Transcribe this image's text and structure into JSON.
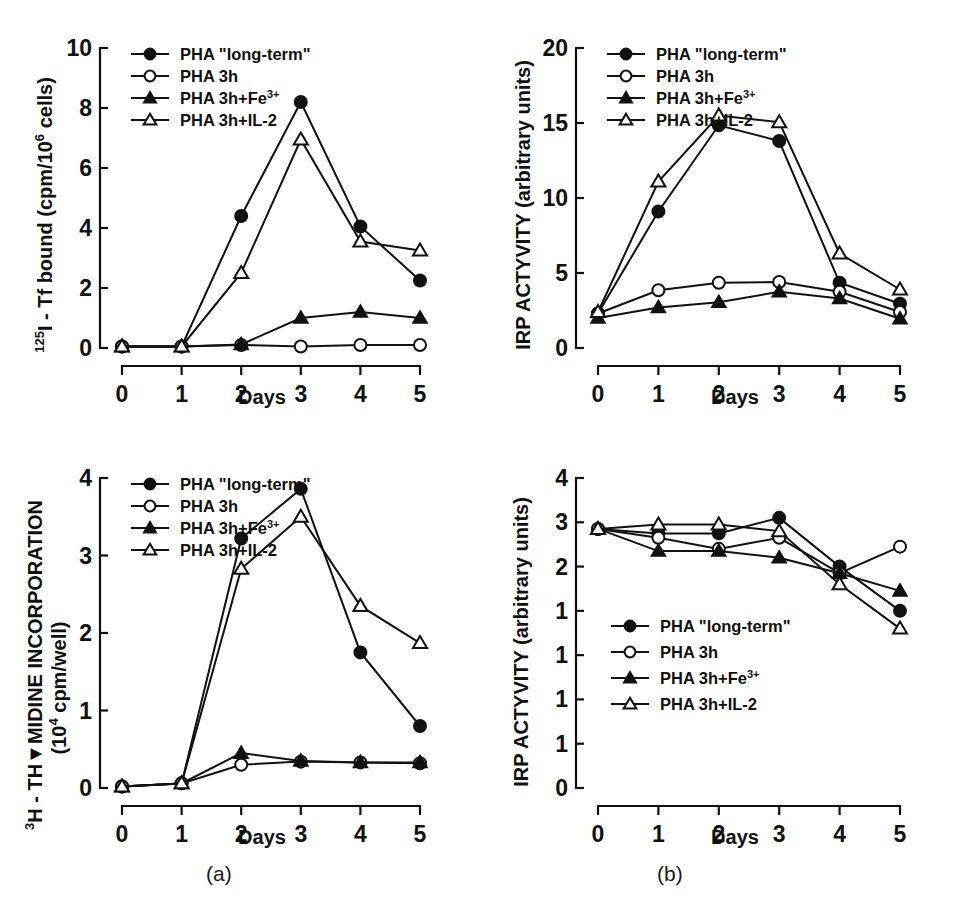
{
  "figure": {
    "captions": [
      {
        "name": "panel-a",
        "label": "(a)"
      },
      {
        "name": "panel-b",
        "label": "(b)"
      }
    ]
  },
  "legend_entries": [
    {
      "label": "PHA \"long-term\"",
      "marker": "filled-circle"
    },
    {
      "label": "PHA 3h",
      "marker": "open-circle"
    },
    {
      "label": "PHA 3h+Fe",
      "sup": "3+",
      "marker": "filled-triangle"
    },
    {
      "label": "PHA 3h+IL-2",
      "marker": "open-triangle"
    }
  ],
  "chart_data": [
    {
      "id": "top-left",
      "type": "line",
      "title": "",
      "xlabel": "Days",
      "ylabel_parts": {
        "sup1": "125",
        "main1": "I - Tf bound (cpm/10",
        "sup2": "6",
        "main2": " cells)"
      },
      "ylabel": "125I - Tf bound (cpm/10^6 cells)",
      "x": [
        0,
        1,
        2,
        3,
        4,
        5
      ],
      "xticklabels": [
        "0",
        "1",
        "2",
        "3",
        "4",
        "5"
      ],
      "yticks": [
        0,
        2,
        4,
        6,
        8,
        10
      ],
      "yticklabels": [
        "0",
        "2",
        "4",
        "6",
        "8",
        "10"
      ],
      "xlim": [
        0,
        5
      ],
      "ylim": [
        0,
        10
      ],
      "grid": false,
      "legend_position": "top-left-inside",
      "series": [
        {
          "name": "PHA \"long-term\"",
          "marker": "filled-circle",
          "values": [
            0.05,
            0.05,
            4.4,
            8.2,
            4.05,
            2.25
          ]
        },
        {
          "name": "PHA 3h",
          "marker": "open-circle",
          "values": [
            0.05,
            0.05,
            0.1,
            0.05,
            0.1,
            0.1
          ]
        },
        {
          "name": "PHA 3h+Fe3+",
          "marker": "filled-triangle",
          "values": [
            0.05,
            0.05,
            0.12,
            1.0,
            1.2,
            1.0
          ]
        },
        {
          "name": "PHA 3h+IL-2",
          "marker": "open-triangle",
          "values": [
            0.05,
            0.05,
            2.5,
            6.95,
            3.55,
            3.25
          ]
        }
      ]
    },
    {
      "id": "top-right",
      "type": "line",
      "title": "",
      "xlabel": "Days",
      "ylabel": "IRP ACTYVITY (arbitrary units)",
      "x": [
        0,
        1,
        2,
        3,
        4,
        5
      ],
      "xticklabels": [
        "0",
        "1",
        "2",
        "3",
        "4",
        "5"
      ],
      "yticks": [
        0,
        5,
        10,
        15,
        20
      ],
      "yticklabels": [
        "0",
        "5",
        "10",
        "15",
        "20"
      ],
      "xlim": [
        0,
        5
      ],
      "ylim": [
        0,
        20
      ],
      "grid": false,
      "legend_position": "top-left-inside",
      "series": [
        {
          "name": "PHA \"long-term\"",
          "marker": "filled-circle",
          "values": [
            2.3,
            9.1,
            14.85,
            13.8,
            4.35,
            2.95
          ]
        },
        {
          "name": "PHA 3h",
          "marker": "open-circle",
          "values": [
            2.3,
            3.85,
            4.35,
            4.4,
            3.75,
            2.4
          ]
        },
        {
          "name": "PHA 3h+Fe3+",
          "marker": "filled-triangle",
          "values": [
            2.0,
            2.7,
            3.05,
            3.75,
            3.3,
            1.95
          ]
        },
        {
          "name": "PHA 3h+IL-2",
          "marker": "open-triangle",
          "values": [
            2.4,
            11.1,
            15.5,
            15.05,
            6.3,
            3.9
          ]
        }
      ]
    },
    {
      "id": "bottom-left",
      "type": "line",
      "title": "",
      "xlabel": "Days",
      "ylabel_parts": {
        "sup1": "3",
        "main1": "H - TH",
        "glyph": "Y",
        "main2": "MIDINE INCORPORATION",
        "line2pre": "(10",
        "sup2": "4",
        "line2post": " cpm/well)"
      },
      "ylabel": "3H - THYMIDINE INCORPORATION (10^4 cpm/well)",
      "x": [
        0,
        1,
        2,
        3,
        4,
        5
      ],
      "xticklabels": [
        "0",
        "1",
        "2",
        "3",
        "4",
        "5"
      ],
      "yticks": [
        0,
        1,
        2,
        3,
        4
      ],
      "yticklabels": [
        "0",
        "1",
        "2",
        "3",
        "4"
      ],
      "xlim": [
        0,
        5
      ],
      "ylim": [
        0,
        4
      ],
      "grid": false,
      "legend_position": "top-left-inside",
      "series": [
        {
          "name": "PHA \"long-term\"",
          "marker": "filled-circle",
          "values": [
            0.02,
            0.06,
            3.22,
            3.86,
            1.75,
            0.8
          ]
        },
        {
          "name": "PHA 3h",
          "marker": "open-circle",
          "values": [
            0.02,
            0.06,
            0.3,
            0.34,
            0.33,
            0.32
          ]
        },
        {
          "name": "PHA 3h+Fe3+",
          "marker": "filled-triangle",
          "values": [
            0.02,
            0.06,
            0.45,
            0.35,
            0.33,
            0.33
          ]
        },
        {
          "name": "PHA 3h+IL-2",
          "marker": "open-triangle",
          "values": [
            0.02,
            0.06,
            2.83,
            3.5,
            2.35,
            1.87
          ]
        }
      ]
    },
    {
      "id": "bottom-right",
      "type": "line",
      "title": "",
      "xlabel": "Days",
      "ylabel": "IRP ACTYVITY (arbitrary units)",
      "x": [
        0,
        1,
        2,
        3,
        4,
        5
      ],
      "xticklabels": [
        "0",
        "1",
        "2",
        "3",
        "4",
        "5"
      ],
      "yticks": [
        0,
        1,
        2,
        3,
        4,
        5,
        6,
        7
      ],
      "yticklabels": [
        "0",
        "1",
        "1",
        "1",
        "1",
        "2",
        "3",
        "4"
      ],
      "xlim": [
        0,
        5
      ],
      "ylim": [
        0,
        7
      ],
      "grid": false,
      "legend_position": "center-left-inside",
      "plot_ymin": 0,
      "plot_ymax": 7,
      "series": [
        {
          "name": "PHA \"long-term\"",
          "marker": "filled-circle",
          "values": [
            5.85,
            5.75,
            5.75,
            6.1,
            5.0,
            4.0
          ]
        },
        {
          "name": "PHA 3h",
          "marker": "open-circle",
          "values": [
            5.85,
            5.65,
            5.4,
            5.65,
            4.85,
            5.45
          ]
        },
        {
          "name": "PHA 3h+Fe3+",
          "marker": "filled-triangle",
          "values": [
            5.85,
            5.35,
            5.35,
            5.2,
            4.85,
            4.45
          ]
        },
        {
          "name": "PHA 3h+IL-2",
          "marker": "open-triangle",
          "values": [
            5.85,
            5.95,
            5.95,
            5.8,
            4.6,
            3.6
          ]
        }
      ]
    }
  ]
}
